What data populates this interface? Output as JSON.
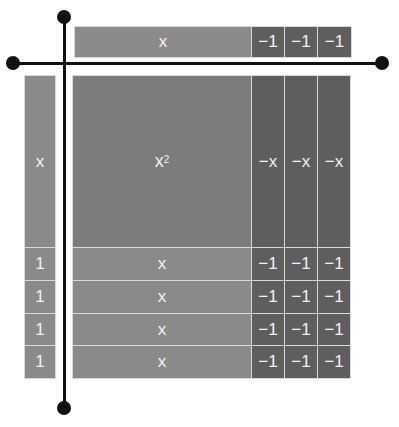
{
  "diagram": {
    "top_factor": {
      "tiles": [
        "x",
        "−1",
        "−1",
        "−1"
      ]
    },
    "left_factor": {
      "tiles": [
        "x",
        "1",
        "1",
        "1",
        "1"
      ]
    },
    "product": {
      "x_squared": {
        "label": "x",
        "exponent": "2"
      },
      "neg_x_tiles": [
        "−x",
        "−x",
        "−x"
      ],
      "x_tiles": [
        "x",
        "x",
        "x",
        "x"
      ],
      "neg_one_rows": [
        [
          "−1",
          "−1",
          "−1"
        ],
        [
          "−1",
          "−1",
          "−1"
        ],
        [
          "−1",
          "−1",
          "−1"
        ],
        [
          "−1",
          "−1",
          "−1"
        ]
      ]
    },
    "colors": {
      "positive_tile": "#8a8a8a",
      "square_tile": "#7c7c7c",
      "negative_tile": "#5e5e5e",
      "axis": "#111111",
      "tile_text": "#f2f2f2"
    }
  }
}
